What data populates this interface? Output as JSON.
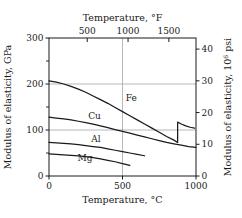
{
  "chart_data": {
    "type": "line",
    "title": "",
    "xlabel": "Temperature, °C",
    "ylabel": "Modulus of elasticity, GPa",
    "x2label": "Temperature, °F",
    "y2label_prefix": "Modulus of elasticity, 10",
    "y2label_sup": "6",
    "y2label_suffix": " psi",
    "xlim": [
      0,
      1000
    ],
    "ylim": [
      0,
      300
    ],
    "x2lim": [
      32,
      1832
    ],
    "y2lim": [
      0,
      43.5
    ],
    "xticks": [
      0,
      500,
      1000
    ],
    "xtick_labels": [
      "0",
      "500",
      "1000"
    ],
    "yticks": [
      0,
      100,
      200,
      300
    ],
    "ytick_labels": [
      "0",
      "100",
      "200",
      "300"
    ],
    "yminor_ticks": [
      50,
      150,
      250
    ],
    "x2ticks": [
      500,
      1000,
      1500
    ],
    "x2tick_labels": [
      "500",
      "1000",
      "1500"
    ],
    "y2ticks": [
      0,
      10,
      20,
      30,
      40
    ],
    "y2tick_labels": [
      "0",
      "10",
      "20",
      "30",
      "40"
    ],
    "gridlines_y": [
      100,
      200
    ],
    "gridlines_x": [
      500
    ],
    "grid": true,
    "legend": "inline-labels",
    "series": [
      {
        "name": "Fe",
        "label": "Fe",
        "label_x": 560,
        "label_y": 163,
        "points": [
          [
            0,
            207
          ],
          [
            50,
            204
          ],
          [
            100,
            200
          ],
          [
            150,
            195
          ],
          [
            200,
            189
          ],
          [
            250,
            182
          ],
          [
            300,
            174
          ],
          [
            350,
            166
          ],
          [
            400,
            158
          ],
          [
            450,
            149
          ],
          [
            500,
            140
          ],
          [
            550,
            131
          ],
          [
            600,
            122
          ],
          [
            650,
            113
          ],
          [
            700,
            104
          ],
          [
            750,
            95
          ],
          [
            800,
            86
          ],
          [
            850,
            78
          ],
          [
            875,
            73
          ]
        ],
        "discontinuity": {
          "at_x": 875,
          "from_y": 73,
          "to_y": 117,
          "note": "alpha-to-gamma phase transition jump"
        },
        "points_after": [
          [
            875,
            117
          ],
          [
            900,
            113
          ],
          [
            930,
            109
          ],
          [
            960,
            106
          ],
          [
            990,
            104
          ]
        ]
      },
      {
        "name": "Cu",
        "label": "Cu",
        "label_x": 310,
        "label_y": 123,
        "points": [
          [
            0,
            128
          ],
          [
            50,
            126
          ],
          [
            100,
            124
          ],
          [
            150,
            122
          ],
          [
            200,
            119
          ],
          [
            250,
            116
          ],
          [
            300,
            113
          ],
          [
            350,
            109
          ],
          [
            400,
            105
          ],
          [
            450,
            101
          ],
          [
            500,
            97
          ],
          [
            550,
            93
          ],
          [
            600,
            89
          ],
          [
            650,
            85
          ],
          [
            700,
            81
          ],
          [
            750,
            77
          ],
          [
            800,
            73
          ],
          [
            850,
            70
          ],
          [
            900,
            67
          ],
          [
            950,
            64
          ],
          [
            1000,
            62
          ]
        ]
      },
      {
        "name": "Al",
        "label": "Al",
        "label_x": 320,
        "label_y": 74,
        "points": [
          [
            0,
            73
          ],
          [
            50,
            72
          ],
          [
            100,
            71
          ],
          [
            150,
            70
          ],
          [
            200,
            68
          ],
          [
            250,
            66
          ],
          [
            300,
            64
          ],
          [
            350,
            62
          ],
          [
            400,
            59
          ],
          [
            450,
            56
          ],
          [
            500,
            53
          ],
          [
            550,
            50
          ],
          [
            600,
            47
          ],
          [
            650,
            44
          ]
        ]
      },
      {
        "name": "Mg",
        "label": "Mg",
        "label_x": 245,
        "label_y": 33,
        "points": [
          [
            0,
            48
          ],
          [
            50,
            47
          ],
          [
            100,
            46
          ],
          [
            150,
            45
          ],
          [
            200,
            44
          ],
          [
            250,
            42
          ],
          [
            300,
            40
          ],
          [
            350,
            37
          ],
          [
            400,
            34
          ],
          [
            450,
            31
          ],
          [
            500,
            27
          ],
          [
            550,
            23
          ]
        ]
      }
    ]
  },
  "figure": {
    "background_color": "#ffffff",
    "axis_color": "#1a1a1a",
    "grid_color": "#9a9a9a",
    "curve_color": "#1a1a1a"
  }
}
